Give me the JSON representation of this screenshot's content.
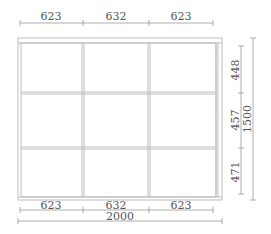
{
  "drawing": {
    "type": "window-frame-elevation",
    "grid": {
      "columns": 3,
      "rows": 3
    },
    "colors": {
      "frame": "#bdbdbd",
      "dimension_line": "#9a9a9a",
      "text": "#555555"
    }
  },
  "dimensions": {
    "top": [
      "623",
      "632",
      "623"
    ],
    "bottom": [
      "623",
      "632",
      "623"
    ],
    "overall_width": "2000",
    "right_rows": [
      "448",
      "457",
      "471"
    ],
    "overall_height": "1500"
  }
}
